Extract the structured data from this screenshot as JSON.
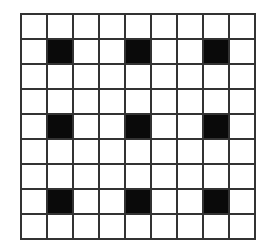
{
  "grid": {
    "rows": 9,
    "cols": 9,
    "filled_color": "#0a0a0a",
    "empty_color": "#ffffff",
    "line_color": "#333333",
    "filled_cells": [
      [
        1,
        1
      ],
      [
        1,
        4
      ],
      [
        1,
        7
      ],
      [
        4,
        1
      ],
      [
        4,
        4
      ],
      [
        4,
        7
      ],
      [
        7,
        1
      ],
      [
        7,
        4
      ],
      [
        7,
        7
      ]
    ]
  }
}
